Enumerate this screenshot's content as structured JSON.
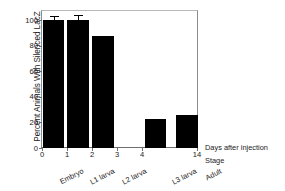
{
  "chart_data": {
    "type": "bar",
    "title": "",
    "xlabel": "Days after injection",
    "ylabel": "Percent Animals With Silenced LacZ",
    "second_xlabel": "Stage",
    "categories": [
      "Embryo",
      "L1 larva",
      "L2 larva",
      "L3 larva",
      "Adult"
    ],
    "x_days": [
      0,
      1,
      2,
      4,
      14
    ],
    "values": [
      100,
      100,
      88,
      23,
      26
    ],
    "errors": [
      3,
      4,
      0,
      0,
      0
    ],
    "ylim": [
      0,
      108
    ],
    "yticks": [
      0,
      20,
      40,
      60,
      80,
      100
    ],
    "ytick_labels": [
      "0",
      "20",
      "40",
      "60",
      "80",
      "100"
    ],
    "xticks": [
      0,
      1,
      2,
      3,
      4,
      14
    ],
    "xtick_labels": [
      "0",
      "1",
      "2",
      "3",
      "4",
      "14"
    ],
    "grid": false,
    "legend": "none",
    "bar_color": "#000000",
    "axis_color": "#6e6e6e"
  },
  "axes": {
    "y_title": "Percent Animals With Silenced LacZ",
    "x_title_days": "Days after injection",
    "x_title_stage": "Stage"
  },
  "yticks": [
    {
      "label": "100",
      "value": 100
    },
    {
      "label": "80",
      "value": 80
    },
    {
      "label": "60",
      "value": 60
    },
    {
      "label": "40",
      "value": 40
    },
    {
      "label": "20",
      "value": 20
    },
    {
      "label": "0",
      "value": 0
    }
  ],
  "xticks": [
    {
      "label": "0",
      "value": 0
    },
    {
      "label": "1",
      "value": 1
    },
    {
      "label": "2",
      "value": 2
    },
    {
      "label": "3",
      "value": 3
    },
    {
      "label": "4",
      "value": 4
    },
    {
      "label": "14",
      "value": 14
    }
  ],
  "stages": [
    {
      "label": "Embryo"
    },
    {
      "label": "L1 larva"
    },
    {
      "label": "L2 larva"
    },
    {
      "label": "L3 larva"
    },
    {
      "label": "Adult"
    }
  ],
  "bars": [
    {
      "label": "Embryo",
      "value": 100,
      "error": 3
    },
    {
      "label": "L1 larva",
      "value": 100,
      "error": 4
    },
    {
      "label": "L2 larva",
      "value": 88,
      "error": 0
    },
    {
      "label": "L3 larva",
      "value": 23,
      "error": 0
    },
    {
      "label": "Adult",
      "value": 26,
      "error": 0
    }
  ]
}
